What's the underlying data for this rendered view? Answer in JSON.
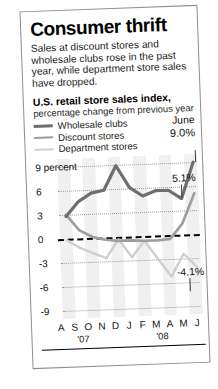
{
  "headline": "Consumer thrift",
  "deck": "Sales at discount stores and wholesale clubs rose in the past year, while department store sales have dropped.",
  "index_title": "U.S. retail store sales index,",
  "index_subtitle": "percentage change from previous year",
  "legend": {
    "items": [
      {
        "label": "Wholesale clubs",
        "color": "#6e6e6e"
      },
      {
        "label": "Discount stores",
        "color": "#9d9d9d"
      },
      {
        "label": "Department stores",
        "color": "#cfcfcf"
      }
    ]
  },
  "callout": {
    "period": "June",
    "top_value": "9.0%",
    "mid_value": "5.1%",
    "bottom_value": "-4.1%"
  },
  "axis": {
    "y_top_label": "9 percent",
    "y_ticks": [
      "9 percent",
      "6",
      "3",
      "0",
      "-3",
      "-6",
      "-9"
    ],
    "x_labels": [
      "A",
      "S",
      "O",
      "N",
      "D",
      "J",
      "F",
      "M",
      "A",
      "M",
      "J"
    ],
    "year_left": "'07",
    "year_right": "'08"
  },
  "chart_data": {
    "type": "line",
    "title": "U.S. retail store sales index,",
    "subtitle": "percentage change from previous year",
    "xlabel": "",
    "ylabel": "percent",
    "ylim": [
      -9,
      9
    ],
    "yticks": [
      -9,
      -6,
      -3,
      0,
      3,
      6,
      9
    ],
    "grid": true,
    "legend_position": "top-left",
    "x": [
      "A '07",
      "S '07",
      "O '07",
      "N '07",
      "D '07",
      "J '08",
      "F '08",
      "M '08",
      "A '08",
      "M '08",
      "J '08"
    ],
    "series": [
      {
        "name": "Wholesale clubs",
        "color": "#6e6e6e",
        "values": [
          2.8,
          4.6,
          5.6,
          5.9,
          8.9,
          6.1,
          5.0,
          5.6,
          5.6,
          4.5,
          9.0
        ],
        "end_label": "9.0%"
      },
      {
        "name": "Discount stores",
        "color": "#9d9d9d",
        "values": [
          3.0,
          1.0,
          0.1,
          -0.3,
          -0.5,
          -0.5,
          -0.6,
          -0.6,
          -0.5,
          1.4,
          5.1
        ],
        "end_label": "5.1%"
      },
      {
        "name": "Department stores",
        "color": "#cfcfcf",
        "values": [
          -0.2,
          -1.2,
          -1.9,
          -2.6,
          -0.3,
          -2.6,
          -0.6,
          -2.9,
          -5.2,
          -2.4,
          -4.1
        ],
        "end_label": "-4.1%"
      }
    ],
    "zero_reference_line": 0,
    "annotations": [
      "June",
      "9.0%",
      "5.1%",
      "-4.1%"
    ]
  }
}
